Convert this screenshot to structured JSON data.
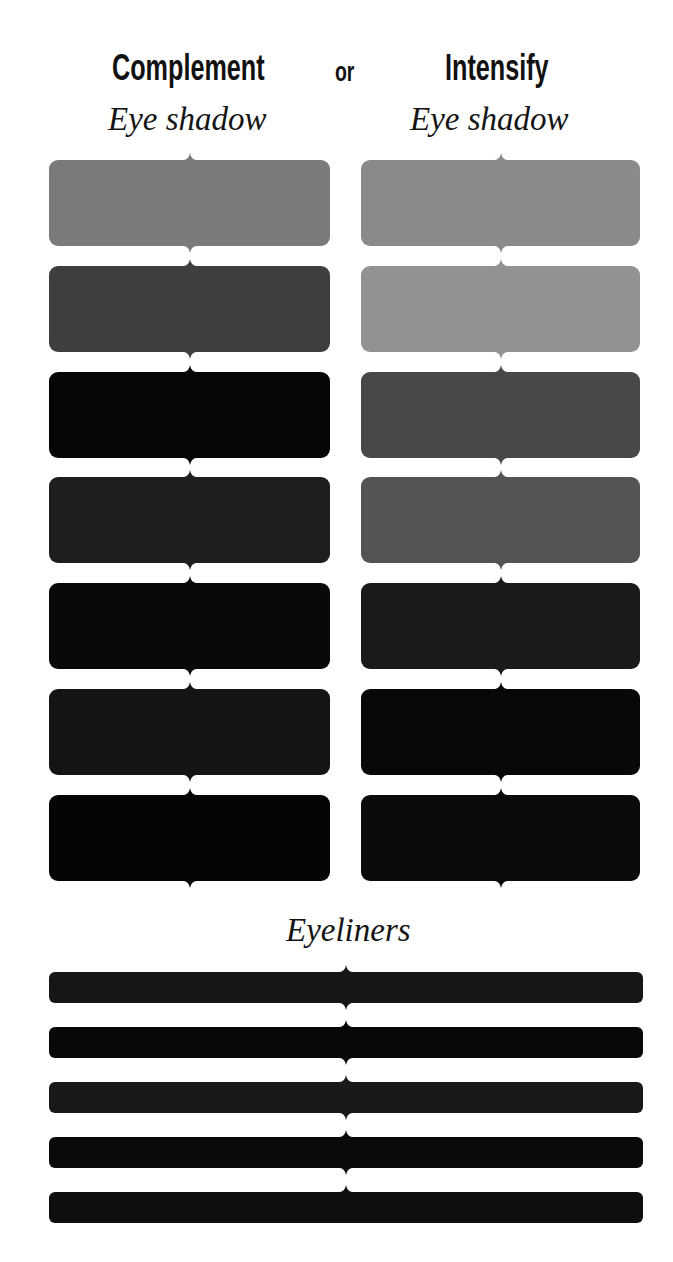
{
  "header": {
    "left_title": "Complement",
    "connector": "or",
    "right_title": "Intensify",
    "left_subtitle": "Eye shadow",
    "right_subtitle": "Eye shadow"
  },
  "eye_shadow": {
    "complement": [
      {
        "color": "#7a7a7a"
      },
      {
        "color": "#3e3e3e"
      },
      {
        "color": "#060606"
      },
      {
        "color": "#1e1e1e"
      },
      {
        "color": "#090909"
      },
      {
        "color": "#141414"
      },
      {
        "color": "#050505"
      }
    ],
    "intensify": [
      {
        "color": "#8a8a8a"
      },
      {
        "color": "#929292"
      },
      {
        "color": "#484848"
      },
      {
        "color": "#545454"
      },
      {
        "color": "#1a1a1a"
      },
      {
        "color": "#080808"
      },
      {
        "color": "#0b0b0b"
      }
    ]
  },
  "eyeliners": {
    "title": "Eyeliners",
    "items": [
      {
        "color": "#161616"
      },
      {
        "color": "#080808"
      },
      {
        "color": "#191919"
      },
      {
        "color": "#0a0a0a"
      },
      {
        "color": "#0e0e0e"
      }
    ]
  }
}
